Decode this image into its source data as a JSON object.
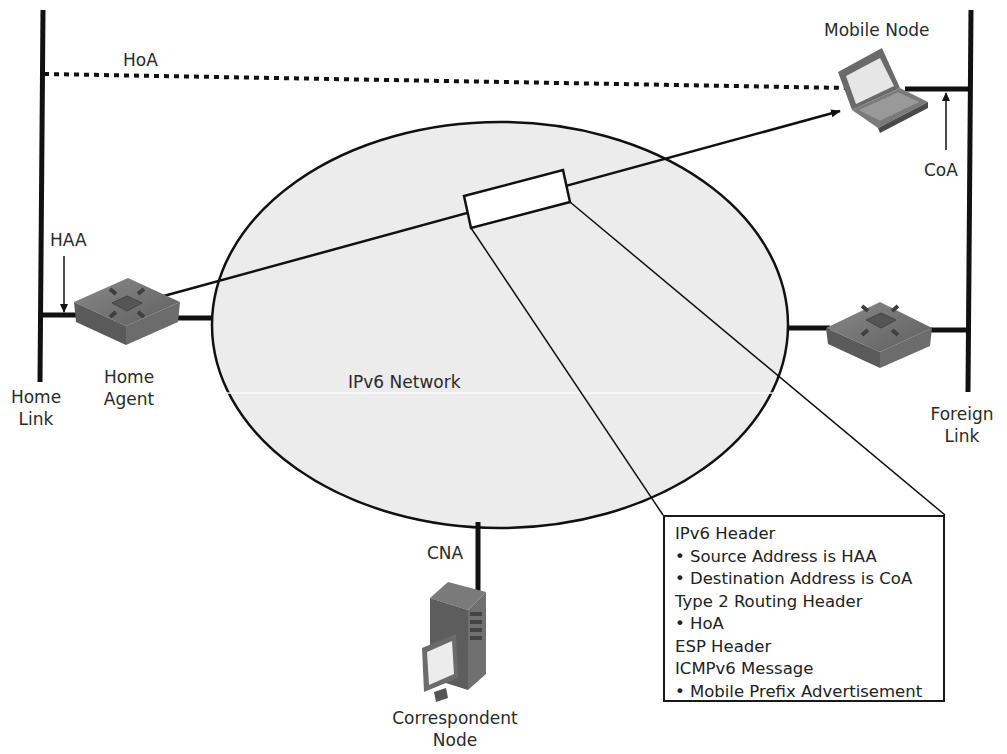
{
  "diagram": {
    "network_label": "IPv6 Network",
    "nodes": {
      "mobile_node": {
        "label": "Mobile Node",
        "icon": "laptop-icon"
      },
      "home_agent": {
        "label_line1": "Home",
        "label_line2": "Agent",
        "icon": "router-icon"
      },
      "foreign_router": {
        "icon": "router-icon"
      },
      "correspondent_node": {
        "label_line1": "Correspondent",
        "label_line2": "Node",
        "icon": "server-workstation-icon"
      }
    },
    "links": {
      "home_link": {
        "label_line1": "Home",
        "label_line2": "Link"
      },
      "foreign_link": {
        "label_line1": "Foreign",
        "label_line2": "Link"
      }
    },
    "addresses": {
      "hoa": "HoA",
      "coa": "CoA",
      "haa": "HAA",
      "cna": "CNA"
    },
    "packet_info": {
      "lines": [
        {
          "text": "IPv6 Header",
          "bullet": false
        },
        {
          "text": "Source Address is HAA",
          "bullet": true
        },
        {
          "text": "Destination Address is CoA",
          "bullet": true
        },
        {
          "text": "Type 2 Routing Header",
          "bullet": false
        },
        {
          "text": "HoA",
          "bullet": true
        },
        {
          "text": "ESP Header",
          "bullet": false
        },
        {
          "text": "ICMPv6 Message",
          "bullet": false
        },
        {
          "text": "Mobile Prefix Advertisement",
          "bullet": true
        }
      ]
    },
    "colors": {
      "line": "#111111",
      "ellipse_fill": "#ececec",
      "device_gray": "#6f6f6f",
      "device_dark": "#4a4a4a",
      "screen": "#e8e8e8"
    }
  }
}
